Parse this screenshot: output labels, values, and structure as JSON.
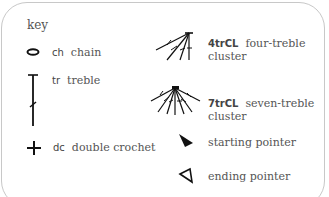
{
  "title": "key",
  "items": [
    {
      "symbol": "chain-oval",
      "abbr": "ch",
      "name": "chain"
    },
    {
      "symbol": "treble-stitch",
      "abbr": "tr",
      "name": "treble"
    },
    {
      "symbol": "plus-cross",
      "abbr": "dc",
      "name": "double crochet"
    },
    {
      "symbol": "four-treble-cluster",
      "abbr": "4trCL",
      "name_line1": "four-treble",
      "name_line2": "cluster"
    },
    {
      "symbol": "seven-treble-cluster",
      "abbr": "7trCL",
      "name_line1": "seven-treble",
      "name_line2": "cluster"
    },
    {
      "symbol": "filled-pointer",
      "name": "starting pointer"
    },
    {
      "symbol": "outline-pointer",
      "name": "ending pointer"
    }
  ]
}
